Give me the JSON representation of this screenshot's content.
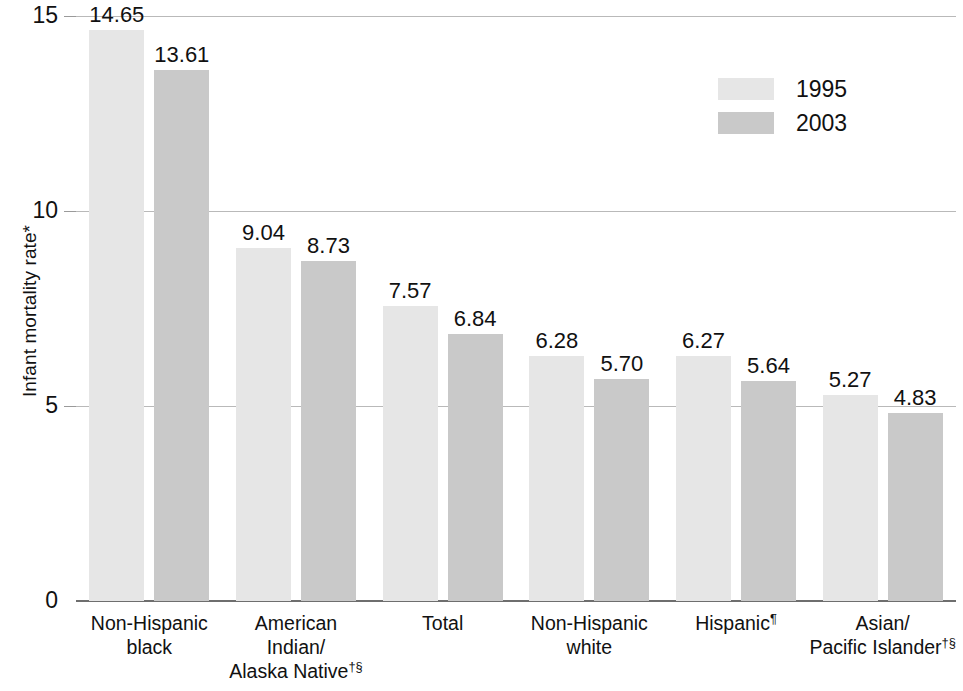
{
  "chart_data": {
    "type": "bar",
    "title": "",
    "xlabel": "",
    "ylabel": "Infant mortality rate*",
    "ylim": [
      0,
      15
    ],
    "yticks": [
      "0",
      "5",
      "10",
      "15"
    ],
    "grid": true,
    "legend_position": "top-right",
    "categories": [
      "Non-Hispanic\nblack",
      "American\nIndian/\nAlaska Native",
      "Total",
      "Non-Hispanic\nwhite",
      "Hispanic",
      "Asian/\nPacific Islander"
    ],
    "category_footnotes": [
      "",
      "†§",
      "",
      "",
      "¶",
      "†§"
    ],
    "series": [
      {
        "name": "1995",
        "color": "#e6e6e6",
        "values": [
          14.65,
          9.04,
          7.57,
          6.28,
          6.27,
          5.27
        ]
      },
      {
        "name": "2003",
        "color": "#c9c9c9",
        "values": [
          13.61,
          8.73,
          6.84,
          5.7,
          5.64,
          4.83
        ]
      }
    ]
  },
  "legend": {
    "items": [
      {
        "label": "1995"
      },
      {
        "label": "2003"
      }
    ]
  }
}
